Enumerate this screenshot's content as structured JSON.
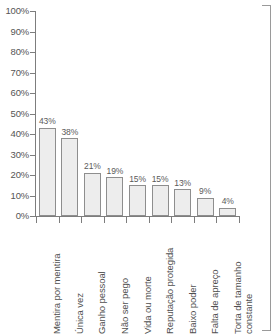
{
  "chart_data": {
    "type": "bar",
    "title": "",
    "subtitle": "",
    "xlabel": "",
    "ylabel": "",
    "ylim": [
      0,
      100
    ],
    "y_unit": "%",
    "grid": false,
    "legend": null,
    "orientation": "vertical",
    "y_ticks": [
      "0%",
      "10%",
      "20%",
      "30%",
      "40%",
      "50%",
      "60%",
      "70%",
      "80%",
      "90%",
      "100%"
    ],
    "y_tick_values": [
      0,
      10,
      20,
      30,
      40,
      50,
      60,
      70,
      80,
      90,
      100
    ],
    "categories": [
      "Mentira por mentira",
      "Única vez",
      "Ganho pessoal",
      "Não ser pego",
      "Vida ou morte",
      "Reputação protegida",
      "Baixo poder",
      "Falta de apreço",
      "Torta de tamanho constante"
    ],
    "category_lines": [
      [
        "Mentira por mentira"
      ],
      [
        "Única vez"
      ],
      [
        "Ganho pessoal"
      ],
      [
        "Não ser pego"
      ],
      [
        "Vida ou morte"
      ],
      [
        "Reputação protegida"
      ],
      [
        "Baixo poder"
      ],
      [
        "Falta de apreço"
      ],
      [
        "Torta de tamanho",
        "constante"
      ]
    ],
    "values": [
      43,
      38,
      21,
      19,
      15,
      15,
      13,
      9,
      4
    ],
    "value_labels": [
      "43%",
      "38%",
      "21%",
      "19%",
      "15%",
      "15%",
      "13%",
      "9%",
      "4%"
    ],
    "colors": {
      "bar_fill": "#ededed",
      "bar_border": "#8e8e8e",
      "axis": "#7d7d7d",
      "text": "#555555",
      "background": "#ffffff"
    }
  }
}
